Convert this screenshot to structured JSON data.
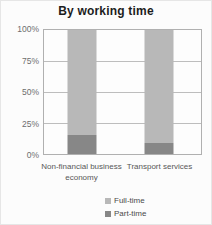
{
  "chart_data": {
    "type": "bar",
    "stacked": true,
    "title": "By working time",
    "categories": [
      "Non-financial business economy",
      "Transport services"
    ],
    "series": [
      {
        "name": "Full-time",
        "color": "#b8b8b8",
        "values": [
          85,
          91
        ]
      },
      {
        "name": "Part-time",
        "color": "#878787",
        "values": [
          15,
          9
        ]
      }
    ],
    "y_ticks": [
      {
        "label": "100%",
        "value": 100
      },
      {
        "label": "75%",
        "value": 75
      },
      {
        "label": "50%",
        "value": 50
      },
      {
        "label": "25%",
        "value": 25
      },
      {
        "label": "0%",
        "value": 0
      }
    ],
    "ylim": [
      0,
      100
    ],
    "grid": true,
    "legend_position": "bottom"
  }
}
